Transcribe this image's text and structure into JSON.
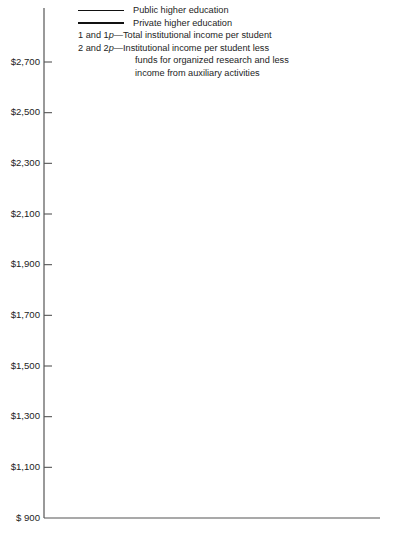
{
  "legend": {
    "entries": [
      {
        "swatch": "thin-line",
        "label": "Public higher education"
      },
      {
        "swatch": "thick-line",
        "label": "Private higher education"
      }
    ],
    "notes": [
      {
        "key_plain": "1 and 1",
        "key_italic": "p",
        "dash": "—",
        "text": "Total institutional income per student"
      },
      {
        "key_plain": "2 and 2",
        "key_italic": "p",
        "dash": "—",
        "text": "Institutional income per student less"
      }
    ],
    "continuation": [
      "funds for organized research and less",
      "income from auxiliary activities"
    ]
  },
  "axis": {
    "y_ticks": [
      "$2,700",
      "$2,500",
      "$2,300",
      "$2,100",
      "$1,900",
      "$1,700",
      "$1,500",
      "$1,300",
      "$1,100",
      "$   900"
    ],
    "y_tick_values": [
      2700,
      2500,
      2300,
      2100,
      1900,
      1700,
      1500,
      1300,
      1100,
      900
    ],
    "x_ticks": [
      "1953",
      "1955",
      "1957",
      "1959",
      "1961",
      "1963",
      "1966"
    ],
    "x_tick_values": [
      1953,
      1955,
      1957,
      1959,
      1961,
      1963,
      1966
    ]
  },
  "series_labels": [
    {
      "plain": "1",
      "italic": "p"
    },
    {
      "plain": "1",
      "italic": ""
    },
    {
      "plain": "2",
      "italic": "p"
    },
    {
      "plain": "2",
      "italic": ""
    }
  ],
  "colors": {
    "line": "#111111",
    "axis": "#555555",
    "background": "#ffffff"
  },
  "chart_data": {
    "type": "line",
    "title": "",
    "subtitle": "",
    "xlabel": "",
    "ylabel": "",
    "x": [
      1953,
      1955,
      1957,
      1959,
      1961,
      1963,
      1966
    ],
    "xlim": [
      1953,
      1966
    ],
    "ylim": [
      880,
      2900
    ],
    "grid": false,
    "legend_position": "top-left",
    "x_tick_labels": [
      "1953",
      "1955",
      "1957",
      "1959",
      "1961",
      "1963",
      "1966"
    ],
    "y_tick_labels": [
      "$   900",
      "$1,100",
      "$1,300",
      "$1,500",
      "$1,700",
      "$1,900",
      "$2,100",
      "$2,300",
      "$2,500",
      "$2,700"
    ],
    "note": "Non-linear x axis: tick spacing is even for 1953-1963 (2-year steps) then a wider gap to 1966 (3-year step).",
    "series": [
      {
        "name": "1p",
        "label": "Total institutional income per student, private higher education",
        "sector": "Private higher education",
        "measure": "Total institutional income per student",
        "style": "thick",
        "values": [
          1200,
          1235,
          1485,
          1670,
          2060,
          2430,
          2855
        ]
      },
      {
        "name": "1",
        "label": "Total institutional income per student, public higher education",
        "sector": "Public higher education",
        "measure": "Total institutional income per student",
        "style": "thin",
        "values": [
          1275,
          1250,
          1370,
          1500,
          1580,
          1680,
          2205
        ]
      },
      {
        "name": "2p",
        "label": "Institutional income per student less research and auxiliary income, private higher education",
        "sector": "Private higher education",
        "measure": "Institutional income per student less funds for organized research and less income from auxiliary activities",
        "style": "thick",
        "values": [
          920,
          985,
          965,
          1055,
          1135,
          1355,
          1710
        ]
      },
      {
        "name": "2",
        "label": "Institutional income per student less research and auxiliary income, public higher education",
        "sector": "Public higher education",
        "measure": "Institutional income per student less funds for organized research and less income from auxiliary activities",
        "style": "thin",
        "values": [
          1040,
          1010,
          1020,
          1055,
          1095,
          1100,
          1395
        ]
      }
    ]
  }
}
